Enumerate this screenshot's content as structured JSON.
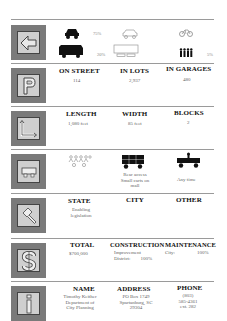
{
  "rows": [
    {
      "id": "mode",
      "icon": "arrow-left-icon",
      "items": [
        {
          "label": "car",
          "value": "75%"
        },
        {
          "label": "van",
          "value": "20%"
        },
        {
          "label": "bus",
          "value": ""
        },
        {
          "label": "bicycle",
          "value": ""
        },
        {
          "label": "pedestrians",
          "value": "5%"
        }
      ]
    },
    {
      "id": "parking",
      "icon": "parking-p-icon",
      "columns": [
        {
          "header": "ON STREET",
          "value": "114"
        },
        {
          "header": "IN LOTS",
          "value": "2,937"
        },
        {
          "header": "IN GARAGES",
          "value": "480"
        }
      ]
    },
    {
      "id": "dimensions",
      "icon": "corner-dimension-icon",
      "columns": [
        {
          "header": "LENGTH",
          "value": "1,080 feet"
        },
        {
          "header": "WIDTH",
          "value": "85 feet"
        },
        {
          "header": "BLOCKS",
          "value": "2"
        }
      ]
    },
    {
      "id": "delivery",
      "icon": "delivery-cart-icon",
      "columns": [
        {
          "header": "",
          "value": ""
        },
        {
          "header": "",
          "value": [
            "Rear access",
            "Small carts on",
            "mall"
          ]
        },
        {
          "header": "",
          "value": "Any time"
        }
      ]
    },
    {
      "id": "legislation",
      "icon": "gavel-icon",
      "columns": [
        {
          "header": "STATE",
          "value": [
            "Enabling",
            "legislation"
          ]
        },
        {
          "header": "CITY",
          "value": ""
        },
        {
          "header": "OTHER",
          "value": ""
        }
      ]
    },
    {
      "id": "cost",
      "icon": "dollar-sign-icon",
      "columns": [
        {
          "header": "TOTAL",
          "value": "$700,000"
        },
        {
          "header": "CONSTRUCTION",
          "value": [
            "Improvement",
            "District:",
            "100%"
          ]
        },
        {
          "header": "MAINTENANCE",
          "value": [
            "City:",
            "100%"
          ]
        }
      ]
    },
    {
      "id": "contact",
      "icon": "info-i-icon",
      "columns": [
        {
          "header": "NAME",
          "value": [
            "Timothy Keither",
            "Department of",
            "City Planning"
          ]
        },
        {
          "header": "ADDRESS",
          "value": [
            "PO Box 1749",
            "Spartanburg, SC",
            "29304"
          ]
        },
        {
          "header": "PHONE",
          "value": [
            "(803)",
            "585-4361",
            "ext. 282"
          ]
        }
      ]
    }
  ],
  "colors": {
    "tile": "#7a7a7a",
    "tile_inner": "#cfcfcf",
    "rule": "#9a9a9a",
    "header_text": "#111111",
    "value_text": "#666666"
  }
}
